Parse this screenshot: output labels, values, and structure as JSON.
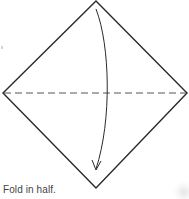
{
  "diagram": {
    "type": "origami-fold-step",
    "shape": "square-rotated-diamond",
    "vertices": {
      "top": [
        96,
        1
      ],
      "right": [
        187,
        93
      ],
      "bottom": [
        96,
        188
      ],
      "left": [
        3,
        93
      ]
    },
    "fold_line": {
      "style": "dashed",
      "from": [
        3,
        93
      ],
      "to": [
        187,
        93
      ],
      "meaning": "valley-fold"
    },
    "arrow": {
      "direction": "top-to-bottom",
      "from": [
        96,
        9
      ],
      "to": [
        96,
        170
      ],
      "curve": "bulges-right"
    },
    "colors": {
      "outline": "#2a2a2a",
      "fold_line": "#555555",
      "arrow": "#2a2a2a",
      "caption": "#444444"
    }
  },
  "caption": "Fold in half."
}
